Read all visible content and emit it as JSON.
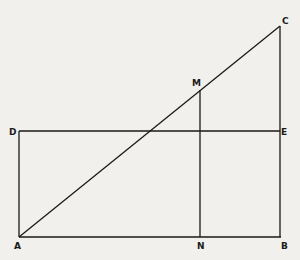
{
  "diagram": {
    "type": "geometric-figure",
    "points": {
      "A": {
        "x": 19,
        "y": 237
      },
      "B": {
        "x": 281,
        "y": 237
      },
      "C": {
        "x": 280,
        "y": 26
      },
      "D": {
        "x": 19,
        "y": 131
      },
      "E": {
        "x": 280,
        "y": 131
      },
      "M": {
        "x": 200,
        "y": 90
      },
      "N": {
        "x": 201,
        "y": 237
      }
    },
    "labels": {
      "A": "A",
      "B": "B",
      "C": "C",
      "D": "D",
      "E": "E",
      "M": "M",
      "N": "N"
    },
    "segments": [
      [
        "A",
        "C"
      ],
      [
        "C",
        "B"
      ],
      [
        "A",
        "B"
      ],
      [
        "D",
        "E"
      ],
      [
        "D",
        "A"
      ],
      [
        "M",
        "N"
      ]
    ],
    "line_color": "#1a1a1a",
    "background_color": "#f1f0ec"
  }
}
